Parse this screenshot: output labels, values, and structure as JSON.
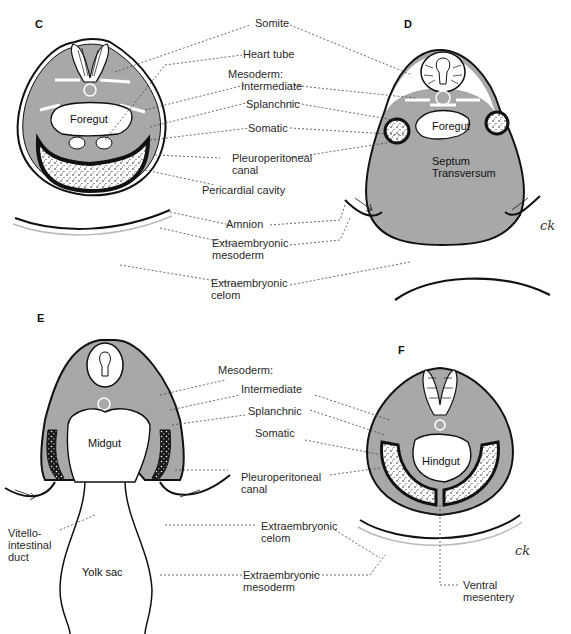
{
  "figure": {
    "panels": [
      {
        "id": "C",
        "letter": "C"
      },
      {
        "id": "D",
        "letter": "D"
      },
      {
        "id": "E",
        "letter": "E"
      },
      {
        "id": "F",
        "letter": "F"
      }
    ],
    "colors": {
      "mesoderm": "#a8a8a8",
      "outline": "#1a1a1a",
      "cavity": "#ffffff",
      "leader": "#444444"
    },
    "signature": "ck"
  },
  "top_labels": {
    "somite": "Somite",
    "heart_tube": "Heart tube",
    "mesoderm_heading": "Mesoderm:",
    "intermediate": "Intermediate",
    "splanchnic": "Splanchnic",
    "somatic": "Somatic",
    "pleuroperitoneal": "Pleuroperitoneal\ncanal",
    "pericardial": "Pericardial cavity",
    "amnion": "Amnion",
    "extra_mesoderm": "Extraembryonic\nmesoderm",
    "extra_celom": "Extraembryonic\ncelom"
  },
  "panel_c": {
    "foregut": "Foregut"
  },
  "panel_d": {
    "foregut": "Foregut",
    "septum": "Septum\nTransversum"
  },
  "bottom_labels": {
    "mesoderm_heading": "Mesoderm:",
    "intermediate": "Intermediate",
    "splanchnic": "Splanchnic",
    "somatic": "Somatic",
    "pleuroperitoneal": "Pleuroperitoneal\ncanal",
    "extra_celom": "Extraembryonic\ncelom",
    "extra_mesoderm": "Extraembryonic\nmesoderm",
    "vitello": "Vitello-\nintestinal\nduct",
    "ventral_mesentery": "Ventral\nmesentery"
  },
  "panel_e": {
    "midgut": "Midgut",
    "yolk_sac": "Yolk sac"
  },
  "panel_f": {
    "hindgut": "Hindgut"
  }
}
